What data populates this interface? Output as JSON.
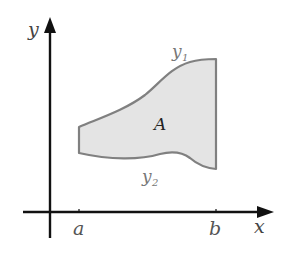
{
  "figure": {
    "axes": {
      "x_label": "x",
      "y_label": "y",
      "axis_color": "#111111"
    },
    "ticks": [
      {
        "label": "a"
      },
      {
        "label": "b"
      }
    ],
    "region": {
      "label": "A",
      "fill_color": "#e4e4e4",
      "outline_color": "#808080"
    },
    "curves": {
      "upper": {
        "label": "y",
        "subscript": "1"
      },
      "lower": {
        "label": "y",
        "subscript": "2"
      }
    },
    "label_color": "#555555"
  }
}
